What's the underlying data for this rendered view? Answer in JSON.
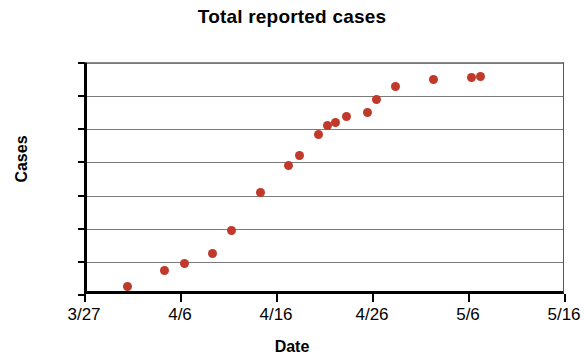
{
  "chart_data": {
    "type": "scatter",
    "title": "Total reported cases",
    "xlabel": "Date",
    "ylabel": "Cases",
    "grid": true,
    "legend": "none",
    "marker_color": "#C0392B",
    "axis_color": "#000000",
    "gridline_color": "#7B7B7B",
    "xlim": [
      "3/27",
      "5/16"
    ],
    "xlim_days": [
      0,
      50
    ],
    "ylim": [
      0,
      140
    ],
    "ytick_labels": [
      "140",
      "120",
      "100",
      "80",
      "60",
      "40",
      "20",
      "0"
    ],
    "ytick_values": [
      140,
      120,
      100,
      80,
      60,
      40,
      20,
      0
    ],
    "xtick_labels": [
      "3/27",
      "4/6",
      "4/16",
      "4/26",
      "5/6",
      "5/16"
    ],
    "xtick_days": [
      0,
      10,
      20,
      30,
      40,
      50
    ],
    "x_dates": [
      "4/0",
      "4/0",
      "4/0",
      "4/0",
      "4/0",
      "4/0",
      "4/0",
      "4/0",
      "4/0",
      "4/0",
      "4/0",
      "4/0",
      "4/0",
      "4/0",
      "4/0",
      "4/0",
      "4/0",
      "4/0",
      "4/0"
    ],
    "points": [
      {
        "day": 4.2,
        "value": 5
      },
      {
        "day": 8.1,
        "value": 15
      },
      {
        "day": 10.2,
        "value": 19
      },
      {
        "day": 13.1,
        "value": 25
      },
      {
        "day": 15.1,
        "value": 39
      },
      {
        "day": 18.1,
        "value": 62
      },
      {
        "day": 21.0,
        "value": 78
      },
      {
        "day": 22.1,
        "value": 84
      },
      {
        "day": 24.1,
        "value": 97
      },
      {
        "day": 25.0,
        "value": 102
      },
      {
        "day": 25.9,
        "value": 104
      },
      {
        "day": 27.0,
        "value": 108
      },
      {
        "day": 29.2,
        "value": 110
      },
      {
        "day": 30.2,
        "value": 118
      },
      {
        "day": 32.1,
        "value": 126
      },
      {
        "day": 36.1,
        "value": 130
      },
      {
        "day": 40.0,
        "value": 131
      },
      {
        "day": 41.0,
        "value": 132
      }
    ]
  }
}
